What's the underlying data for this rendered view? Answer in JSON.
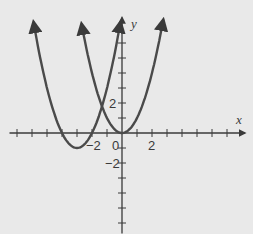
{
  "chart_data": {
    "type": "line",
    "title": "",
    "xlabel": "x",
    "ylabel": "y",
    "xlim": [
      -7.5,
      8.2
    ],
    "ylim": [
      -6.7,
      7.7
    ],
    "grid": false,
    "x_tick_labels": [
      {
        "value": -2,
        "label": "−2"
      },
      {
        "value": 0,
        "label": "0"
      },
      {
        "value": 2,
        "label": "2"
      }
    ],
    "y_tick_labels": [
      {
        "value": 2,
        "label": "2"
      },
      {
        "value": -2,
        "label": "−2"
      }
    ],
    "series": [
      {
        "name": "y = (x + 3)^2 - 1",
        "vertex": [
          -3,
          -1
        ],
        "x_range": [
          -5.9,
          -0.1
        ],
        "color": "#4a4a4a"
      },
      {
        "name": "y = x^2",
        "vertex": [
          0,
          0
        ],
        "x_range": [
          -2.7,
          2.75
        ],
        "color": "#4a4a4a"
      }
    ]
  },
  "graph": {
    "origin_px": [
      122,
      133
    ],
    "unit_px": 15,
    "x_axis_label": "x",
    "y_axis_label": "y",
    "label_zero": "0",
    "label_x_neg2": "−2",
    "label_x_2": "2",
    "label_y_2": "2",
    "label_y_neg2": "−2"
  }
}
